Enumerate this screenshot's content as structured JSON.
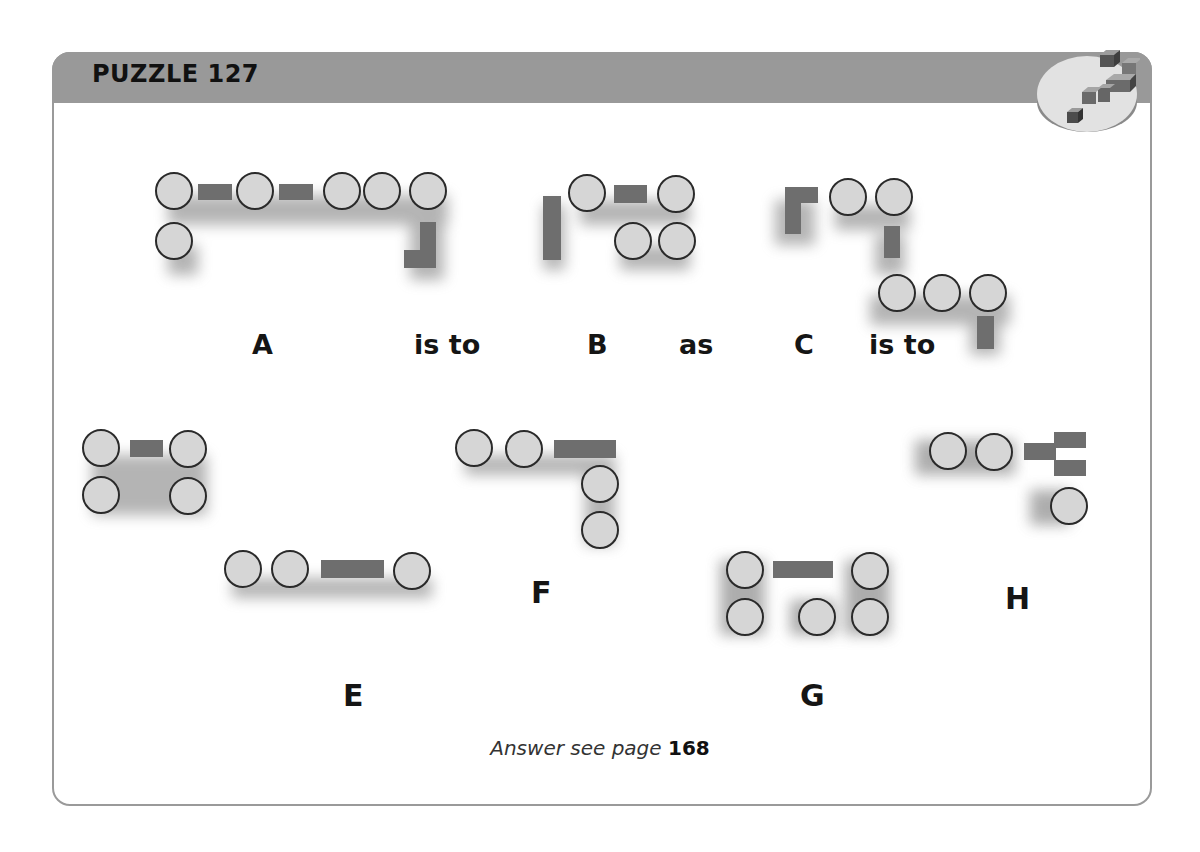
{
  "header": {
    "title": "PUZZLE 127",
    "bar_color": "#999999",
    "badge_icon": "question-mark-blocks-icon"
  },
  "colors": {
    "circle_fill": "#d6d6d6",
    "circle_stroke": "#2a2a2a",
    "bar_fill": "#6e6e6e",
    "frame_stroke": "#9a9a9a",
    "shadow": "#555555"
  },
  "statement": {
    "label_a": "A",
    "connector_1": "is to",
    "label_b": "B",
    "connector_2": "as",
    "label_c": "C",
    "connector_3": "is to"
  },
  "options": {
    "label_e": "E",
    "label_f": "F",
    "label_g": "G",
    "label_h": "H"
  },
  "footer": {
    "answer_text": "Answer see page",
    "answer_page": "168"
  },
  "figures": {
    "A": {
      "circles": [
        [
          174,
          191
        ],
        [
          255,
          191
        ],
        [
          343,
          191
        ],
        [
          383,
          191
        ],
        [
          429,
          191
        ],
        [
          174,
          241
        ]
      ],
      "bars": [
        [
          198,
          184,
          34,
          16
        ],
        [
          279,
          184,
          34,
          16
        ],
        [
          404,
          222,
          18,
          46
        ],
        [
          404,
          252,
          32,
          16
        ]
      ]
    },
    "B": {
      "circles": [
        [
          587,
          193
        ],
        [
          675,
          193
        ],
        [
          633,
          241
        ],
        [
          677,
          241
        ]
      ],
      "bars": [
        [
          543,
          196,
          18,
          64
        ],
        [
          615,
          185,
          32,
          18
        ]
      ]
    },
    "C": {
      "circles": [
        [
          848,
          196
        ],
        [
          894,
          196
        ],
        [
          897,
          292
        ],
        [
          941,
          292
        ],
        [
          988,
          292
        ]
      ],
      "bars": [
        [
          785,
          187,
          16,
          46
        ],
        [
          785,
          187,
          32,
          16
        ],
        [
          884,
          226,
          16,
          32
        ],
        [
          978,
          316,
          16,
          32
        ]
      ]
    },
    "E": {
      "circles": [
        [
          101,
          448
        ],
        [
          188,
          448
        ],
        [
          101,
          496
        ],
        [
          188,
          496
        ]
      ],
      "bars": [
        [
          130,
          440,
          33,
          17
        ]
      ],
      "circles2": [
        [
          243,
          569
        ],
        [
          290,
          569
        ],
        [
          412,
          571
        ]
      ],
      "bars2": [
        [
          321,
          561,
          63,
          17
        ]
      ]
    },
    "F": {
      "circles": [
        [
          474,
          448
        ],
        [
          524,
          449
        ],
        [
          600,
          484
        ],
        [
          600,
          530
        ]
      ],
      "bars": [
        [
          554,
          441,
          62,
          17
        ]
      ]
    },
    "G": {
      "circles": [
        [
          745,
          570
        ],
        [
          870,
          571
        ],
        [
          745,
          616
        ],
        [
          817,
          617
        ],
        [
          870,
          617
        ]
      ],
      "bars": [
        [
          773,
          561,
          60,
          17
        ]
      ]
    },
    "H": {
      "circles": [
        [
          948,
          451
        ],
        [
          994,
          452
        ],
        [
          1069,
          506
        ]
      ],
      "bars": [
        [
          1024,
          443,
          32,
          17
        ],
        [
          1054,
          432,
          32,
          16
        ],
        [
          1054,
          460,
          32,
          16
        ]
      ]
    }
  }
}
